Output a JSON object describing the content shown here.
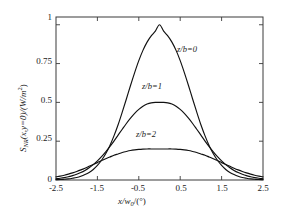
{
  "chart_data": {
    "type": "line",
    "title": "",
    "xlabel": "x/w0/(°)",
    "ylabel": "SNR(x,y=0)/(W/m2)",
    "xlim": [
      -2.5,
      2.5
    ],
    "ylim": [
      0,
      1.05
    ],
    "grid": false,
    "legend_position": "inline-annotations",
    "xticks": [
      "-2.5",
      "-1.5",
      "-0.5",
      "0.5",
      "1.5",
      "2.5"
    ],
    "xtick_values": [
      -2.5,
      -1.5,
      -0.5,
      0.5,
      1.5,
      2.5
    ],
    "yticks": [
      "0",
      "0.25",
      "0.5",
      "0.75",
      "1"
    ],
    "ytick_values": [
      0,
      0.25,
      0.5,
      0.75,
      1
    ],
    "x": [
      -2.5,
      -2.4,
      -2.3,
      -2.2,
      -2.1,
      -2.0,
      -1.9,
      -1.8,
      -1.7,
      -1.6,
      -1.5,
      -1.4,
      -1.3,
      -1.2,
      -1.1,
      -1.0,
      -0.9,
      -0.8,
      -0.7,
      -0.6,
      -0.5,
      -0.4,
      -0.3,
      -0.2,
      -0.1,
      0.0,
      0.1,
      0.2,
      0.3,
      0.4,
      0.5,
      0.6,
      0.7,
      0.8,
      0.9,
      1.0,
      1.1,
      1.2,
      1.3,
      1.4,
      1.5,
      1.6,
      1.7,
      1.8,
      1.9,
      2.0,
      2.1,
      2.2,
      2.3,
      2.4,
      2.5
    ],
    "series": [
      {
        "name": "z/b=0",
        "label": "z/b=0",
        "peak": 1.0,
        "peak_x": 0.0,
        "values": [
          0.002,
          0.003,
          0.005,
          0.007,
          0.011,
          0.016,
          0.024,
          0.035,
          0.049,
          0.068,
          0.094,
          0.127,
          0.169,
          0.221,
          0.284,
          0.356,
          0.437,
          0.522,
          0.609,
          0.692,
          0.769,
          0.835,
          0.888,
          0.928,
          0.959,
          1.0,
          0.959,
          0.928,
          0.888,
          0.835,
          0.769,
          0.692,
          0.609,
          0.522,
          0.437,
          0.356,
          0.284,
          0.221,
          0.169,
          0.127,
          0.094,
          0.068,
          0.049,
          0.035,
          0.024,
          0.016,
          0.011,
          0.007,
          0.005,
          0.003,
          0.002
        ]
      },
      {
        "name": "z/b=1",
        "label": "z/b=1",
        "peak": 0.5,
        "peak_x": 0.0,
        "values": [
          0.008,
          0.011,
          0.015,
          0.021,
          0.028,
          0.037,
          0.048,
          0.062,
          0.079,
          0.099,
          0.123,
          0.15,
          0.181,
          0.215,
          0.251,
          0.289,
          0.327,
          0.364,
          0.398,
          0.429,
          0.455,
          0.475,
          0.489,
          0.497,
          0.5,
          0.5,
          0.5,
          0.497,
          0.489,
          0.475,
          0.455,
          0.429,
          0.398,
          0.364,
          0.327,
          0.289,
          0.251,
          0.215,
          0.181,
          0.15,
          0.123,
          0.099,
          0.079,
          0.062,
          0.048,
          0.037,
          0.028,
          0.021,
          0.015,
          0.011,
          0.008
        ]
      },
      {
        "name": "z/b=2",
        "label": "z/b=2",
        "peak": 0.2,
        "peak_x": 0.0,
        "values": [
          0.02,
          0.025,
          0.031,
          0.038,
          0.046,
          0.055,
          0.065,
          0.076,
          0.088,
          0.1,
          0.112,
          0.125,
          0.137,
          0.148,
          0.159,
          0.168,
          0.177,
          0.184,
          0.19,
          0.194,
          0.197,
          0.199,
          0.2,
          0.2,
          0.2,
          0.2,
          0.2,
          0.2,
          0.2,
          0.199,
          0.197,
          0.194,
          0.19,
          0.184,
          0.177,
          0.168,
          0.159,
          0.148,
          0.137,
          0.125,
          0.112,
          0.1,
          0.088,
          0.076,
          0.065,
          0.055,
          0.046,
          0.038,
          0.031,
          0.025,
          0.02
        ]
      }
    ],
    "annotations": [
      {
        "text": "z/b=0",
        "x": 0.62,
        "y": 0.84
      },
      {
        "text": "z/b=1",
        "x": 0.08,
        "y": 0.6
      },
      {
        "text": "z/b=2",
        "x": 0.03,
        "y": 0.31
      }
    ],
    "line_color": "#111111"
  },
  "axis": {
    "ylabel_main": "S",
    "ylabel_sub": "NR",
    "ylabel_args": "(x,y=0)/(W/m",
    "ylabel_sup": "2",
    "ylabel_tail": ")",
    "xlabel_main": "x/w",
    "xlabel_sub": "0",
    "xlabel_tail": "/(°)"
  }
}
